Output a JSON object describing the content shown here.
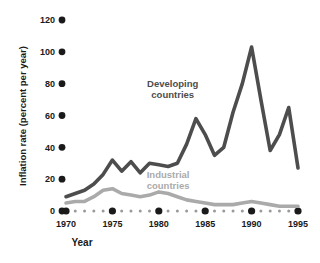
{
  "chart_data": {
    "type": "line",
    "title": "",
    "xlabel": "Year",
    "ylabel": "Inflation rate (percent per year)",
    "xlim": [
      1970,
      1996
    ],
    "ylim": [
      0,
      120
    ],
    "xticks": [
      1970,
      1975,
      1980,
      1985,
      1990,
      1995
    ],
    "xtick_labels": [
      "1970",
      "1975",
      "1980",
      "1985",
      "1990",
      "1995"
    ],
    "yticks": [
      0,
      20,
      40,
      60,
      80,
      100,
      120
    ],
    "ytick_labels": [
      "0",
      "20",
      "40",
      "60",
      "80",
      "100",
      "120"
    ],
    "grid": false,
    "legend_position": "inline-annotations",
    "x": [
      1970,
      1971,
      1972,
      1973,
      1974,
      1975,
      1976,
      1977,
      1978,
      1979,
      1980,
      1981,
      1982,
      1983,
      1984,
      1985,
      1986,
      1987,
      1988,
      1989,
      1990,
      1991,
      1992,
      1993,
      1994,
      1995
    ],
    "series": [
      {
        "name": "Developing countries",
        "color": "#4d4d4d",
        "label_x": 1981.5,
        "label_y": 78,
        "values": [
          9,
          11,
          13,
          17,
          23,
          32,
          25,
          31,
          24,
          30,
          29,
          28,
          30,
          42,
          58,
          48,
          35,
          40,
          62,
          80,
          103,
          70,
          38,
          48,
          65,
          27
        ]
      },
      {
        "name": "Industrial countries",
        "color": "#aaaaaa",
        "label_x": 1981.0,
        "label_y": 21,
        "values": [
          5,
          6,
          6,
          9,
          13,
          14,
          11,
          10,
          9,
          10,
          12,
          11,
          9,
          7,
          6,
          5,
          4,
          4,
          4,
          5,
          6,
          5,
          4,
          3,
          3,
          3
        ]
      }
    ],
    "axis_dot_color": "#1a1a1a",
    "axis_dotted_color": "#9a9a9a"
  },
  "labels": {
    "x_axis_title": "Year",
    "y_axis_title": "Inflation rate (percent per year)",
    "developing": "Developing\ncountries",
    "developing_line1": "Developing",
    "developing_line2": "countries",
    "industrial_line1": "Industrial",
    "industrial_line2": "countries"
  }
}
